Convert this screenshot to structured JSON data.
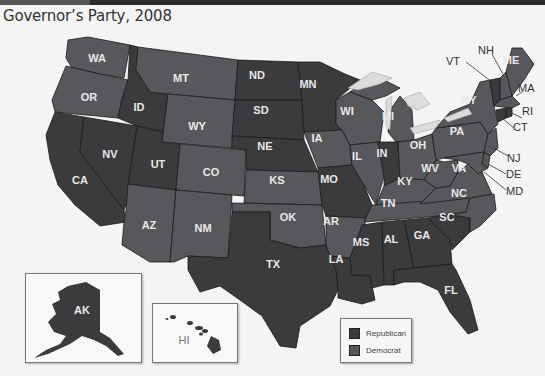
{
  "title": "Governor’s Party, 2008",
  "colors": {
    "republican": "#3b3b3d",
    "democrat": "#58585c",
    "water": "#dcdcdc",
    "background": "#f4f4f4"
  },
  "legend": {
    "items": [
      {
        "label": "Republican",
        "color": "#3b3b3d"
      },
      {
        "label": "Democrat",
        "color": "#58585c"
      }
    ]
  },
  "states": {
    "WA": {
      "label": "WA",
      "party": "Democrat"
    },
    "OR": {
      "label": "OR",
      "party": "Democrat"
    },
    "CA": {
      "label": "CA",
      "party": "Republican"
    },
    "NV": {
      "label": "NV",
      "party": "Republican"
    },
    "ID": {
      "label": "ID",
      "party": "Republican"
    },
    "MT": {
      "label": "MT",
      "party": "Democrat"
    },
    "WY": {
      "label": "WY",
      "party": "Democrat"
    },
    "UT": {
      "label": "UT",
      "party": "Republican"
    },
    "AZ": {
      "label": "AZ",
      "party": "Democrat"
    },
    "CO": {
      "label": "CO",
      "party": "Democrat"
    },
    "NM": {
      "label": "NM",
      "party": "Democrat"
    },
    "ND": {
      "label": "ND",
      "party": "Republican"
    },
    "SD": {
      "label": "SD",
      "party": "Republican"
    },
    "NE": {
      "label": "NE",
      "party": "Republican"
    },
    "KS": {
      "label": "KS",
      "party": "Democrat"
    },
    "OK": {
      "label": "OK",
      "party": "Democrat"
    },
    "TX": {
      "label": "TX",
      "party": "Republican"
    },
    "MN": {
      "label": "MN",
      "party": "Republican"
    },
    "IA": {
      "label": "IA",
      "party": "Democrat"
    },
    "MO": {
      "label": "MO",
      "party": "Republican"
    },
    "AR": {
      "label": "AR",
      "party": "Democrat"
    },
    "LA": {
      "label": "LA",
      "party": "Republican"
    },
    "WI": {
      "label": "WI",
      "party": "Democrat"
    },
    "IL": {
      "label": "IL",
      "party": "Democrat"
    },
    "MI": {
      "label": "MI",
      "party": "Democrat"
    },
    "IN": {
      "label": "IN",
      "party": "Republican"
    },
    "OH": {
      "label": "OH",
      "party": "Democrat"
    },
    "KY": {
      "label": "KY",
      "party": "Democrat"
    },
    "TN": {
      "label": "TN",
      "party": "Democrat"
    },
    "MS": {
      "label": "MS",
      "party": "Republican"
    },
    "AL": {
      "label": "AL",
      "party": "Republican"
    },
    "GA": {
      "label": "GA",
      "party": "Republican"
    },
    "FL": {
      "label": "FL",
      "party": "Republican"
    },
    "SC": {
      "label": "SC",
      "party": "Republican"
    },
    "NC": {
      "label": "NC",
      "party": "Democrat"
    },
    "VA": {
      "label": "VA",
      "party": "Democrat"
    },
    "WV": {
      "label": "WV",
      "party": "Democrat"
    },
    "PA": {
      "label": "PA",
      "party": "Democrat"
    },
    "NY": {
      "label": "NY",
      "party": "Democrat"
    },
    "VT": {
      "label": "VT",
      "party": "Republican"
    },
    "NH": {
      "label": "NH",
      "party": "Democrat"
    },
    "ME": {
      "label": "ME",
      "party": "Democrat"
    },
    "MA": {
      "label": "MA",
      "party": "Democrat"
    },
    "RI": {
      "label": "RI",
      "party": "Republican"
    },
    "CT": {
      "label": "CT",
      "party": "Republican"
    },
    "NJ": {
      "label": "NJ",
      "party": "Democrat"
    },
    "DE": {
      "label": "DE",
      "party": "Democrat"
    },
    "MD": {
      "label": "MD",
      "party": "Democrat"
    },
    "AK": {
      "label": "AK",
      "party": "Republican"
    },
    "HI": {
      "label": "HI",
      "party": "Republican"
    }
  }
}
